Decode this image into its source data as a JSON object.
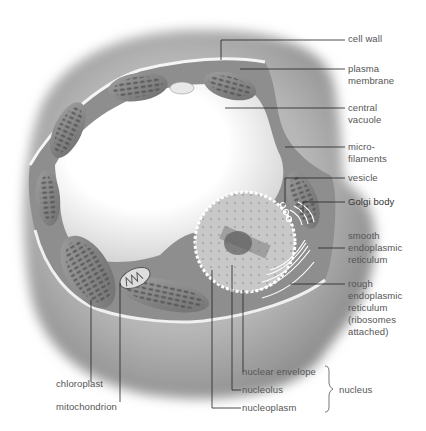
{
  "diagram": {
    "labels": {
      "cell_wall": "cell wall",
      "plasma_membrane": "plasma\nmembrane",
      "central_vacuole": "central\nvacuole",
      "microfilaments": "micro-\nfilaments",
      "vesicle": "vesicle",
      "golgi_body": "Golgi body",
      "smooth_er": "smooth\nendoplasmic\nreticulum",
      "rough_er": "rough\nendoplasmic\nreticulum\n(ribosomes\nattached)",
      "nuclear_envelope": "nuclear envelope",
      "nucleolus": "nucleolus",
      "nucleoplasm": "nucleoplasm",
      "nucleus": "nucleus",
      "chloroplast": "chloroplast",
      "mitochondrion": "mitochondrion"
    },
    "colors": {
      "background": "#ffffff",
      "wall_outer": "#9a9a9a",
      "cytoplasm": "#8c8c8c",
      "membrane": "#f2f2f2",
      "chloroplast": "#7d7d7d",
      "line": "#222222",
      "text": "#555555"
    }
  }
}
